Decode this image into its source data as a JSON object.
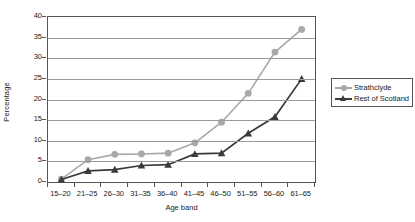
{
  "chart_data": {
    "type": "line",
    "title": "",
    "xlabel": "Age band",
    "ylabel": "Percentage",
    "categories": [
      "15–20",
      "21–25",
      "26–30",
      "31–35",
      "36–40",
      "41–45",
      "46–50",
      "51–55",
      "56–60",
      "61–65"
    ],
    "yticks": [
      0,
      5,
      10,
      15,
      20,
      25,
      30,
      35,
      40
    ],
    "ylim": [
      0,
      40
    ],
    "grid": true,
    "legend_position": "right",
    "series": [
      {
        "name": "Strathclyde",
        "color": "#a8a8a8",
        "marker": "circle",
        "values": [
          0.7,
          5.4,
          6.7,
          6.8,
          7.0,
          9.5,
          14.5,
          21.5,
          31.5,
          37.0
        ]
      },
      {
        "name": "Rest of Scotland",
        "color": "#3a3a3a",
        "marker": "triangle",
        "values": [
          0.6,
          2.7,
          3.0,
          4.0,
          4.2,
          6.8,
          7.0,
          11.8,
          15.8,
          25.0
        ]
      }
    ]
  },
  "legend": {
    "entries": [
      "Strathclyde",
      "Rest of Scotland"
    ]
  },
  "colors": {
    "strathclyde": "#a8a8a8",
    "rest_of_scotland": "#3a3a3a",
    "grid": "#9b9b9b",
    "axis": "#555555"
  }
}
